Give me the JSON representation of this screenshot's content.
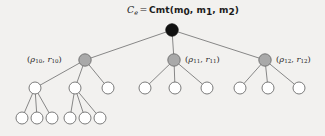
{
  "figure": {
    "type": "tree-diagram",
    "background_color": "#f2f1ef",
    "width": 325,
    "height": 136
  },
  "root": {
    "label_prefix": "C",
    "label_subscript": "e",
    "equals": "=",
    "function_name": "Cmt",
    "open_paren": "(",
    "arg0": "m",
    "arg0_sub": "0",
    "comma0": ", ",
    "arg1": "m",
    "arg1_sub": "1",
    "comma1": ", ",
    "arg2": "m",
    "arg2_sub": "2",
    "close_paren": ")",
    "full_text": "C_e = Cmt(m_0, m_1, m_2)",
    "node_color": "#111111",
    "node_x": 172,
    "node_y": 30,
    "node_r": 6.2
  },
  "level1": {
    "node_color": "#a9a9a9",
    "node_stroke": "#6d6d6d",
    "node_r": 6.2,
    "node_y": 60,
    "nodes": [
      {
        "id": "rho-r-10",
        "x": 85,
        "label_open": "(",
        "rho": "ρ",
        "rho_sub": "10",
        "sep": ", ",
        "r": "r",
        "r_sub": "10",
        "label_close": ")",
        "full_text": "(ρ_10, r_10)",
        "label_side": "left",
        "child_count": 3
      },
      {
        "id": "rho-r-11",
        "x": 174,
        "label_open": "(",
        "rho": "ρ",
        "rho_sub": "11",
        "sep": ", ",
        "r": "r",
        "r_sub": "11",
        "label_close": ")",
        "full_text": "(ρ_11, r_11)",
        "label_side": "right",
        "child_count": 3
      },
      {
        "id": "rho-r-12",
        "x": 265,
        "label_open": "(",
        "rho": "ρ",
        "rho_sub": "12",
        "sep": ", ",
        "r": "r",
        "r_sub": "12",
        "label_close": ")",
        "full_text": "(ρ_12, r_12)",
        "label_side": "right",
        "child_count": 3
      }
    ]
  },
  "level2": {
    "node_fill": "#ffffff",
    "node_stroke": "#6d6d6d",
    "node_r": 6.0,
    "node_y": 88,
    "nodes": [
      {
        "id": "l2-a",
        "x": 35,
        "parent": "rho-r-10",
        "child_count": 3
      },
      {
        "id": "l2-b",
        "x": 75,
        "parent": "rho-r-10",
        "child_count": 3
      },
      {
        "id": "l2-c",
        "x": 108,
        "parent": "rho-r-10",
        "child_count": 0
      },
      {
        "id": "l2-d",
        "x": 145,
        "parent": "rho-r-11",
        "child_count": 0
      },
      {
        "id": "l2-e",
        "x": 175,
        "parent": "rho-r-11",
        "child_count": 0
      },
      {
        "id": "l2-f",
        "x": 207,
        "parent": "rho-r-11",
        "child_count": 0
      },
      {
        "id": "l2-g",
        "x": 240,
        "parent": "rho-r-12",
        "child_count": 0
      },
      {
        "id": "l2-h",
        "x": 268,
        "parent": "rho-r-12",
        "child_count": 0
      },
      {
        "id": "l2-i",
        "x": 299,
        "parent": "rho-r-12",
        "child_count": 0
      }
    ]
  },
  "level3": {
    "node_fill": "#ffffff",
    "node_stroke": "#6d6d6d",
    "node_r": 6.0,
    "node_y": 118,
    "nodes": [
      {
        "id": "l3-a",
        "x": 22,
        "parent": "l2-a"
      },
      {
        "id": "l3-b",
        "x": 37,
        "parent": "l2-a"
      },
      {
        "id": "l3-c",
        "x": 52,
        "parent": "l2-a"
      },
      {
        "id": "l3-d",
        "x": 70,
        "parent": "l2-b"
      },
      {
        "id": "l3-e",
        "x": 85,
        "parent": "l2-b"
      },
      {
        "id": "l3-f",
        "x": 100,
        "parent": "l2-b"
      }
    ]
  },
  "edges": {
    "stroke_color": "#7a7a7a",
    "stroke_width": 0.9
  }
}
